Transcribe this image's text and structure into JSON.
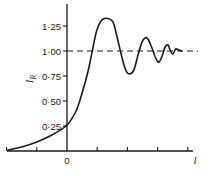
{
  "chart_data": {
    "type": "line",
    "title": "",
    "xlabel": "l",
    "ylabel": "I_R",
    "ylabel_main": "I",
    "ylabel_sub": "R",
    "x_origin_label": "0",
    "yticks": [
      0.25,
      0.5,
      0.75,
      1.0,
      1.25
    ],
    "ytick_labels": [
      "0·25",
      "0·50",
      "0·75",
      "1·00",
      "1·25"
    ],
    "ylim": [
      0,
      1.45
    ],
    "xlim": [
      -2,
      4.2
    ],
    "xticks": [
      -2,
      -1,
      0,
      1,
      2,
      3,
      4
    ],
    "grid": false,
    "reference_line": {
      "y": 1.0,
      "style": "dashed"
    },
    "series": [
      {
        "name": "I_R",
        "x": [
          -1.95,
          -1.5,
          -1.0,
          -0.5,
          0.0,
          0.3,
          0.5,
          0.7,
          0.85,
          1.0,
          1.2,
          1.5,
          1.65,
          1.85,
          2.0,
          2.2,
          2.35,
          2.5,
          2.65,
          2.8,
          2.95,
          3.05,
          3.15,
          3.25,
          3.35,
          3.4,
          3.5,
          3.6,
          3.7,
          3.8
        ],
        "y": [
          0.01,
          0.04,
          0.09,
          0.16,
          0.26,
          0.4,
          0.58,
          0.8,
          1.02,
          1.22,
          1.32,
          1.3,
          1.15,
          0.9,
          0.78,
          0.8,
          0.96,
          1.1,
          1.13,
          1.04,
          0.92,
          0.89,
          0.95,
          1.04,
          1.06,
          1.02,
          0.97,
          1.02,
          1.01,
          1.0
        ]
      }
    ]
  },
  "colors": {
    "ink": "#1a1a1a",
    "background": "#ffffff"
  }
}
